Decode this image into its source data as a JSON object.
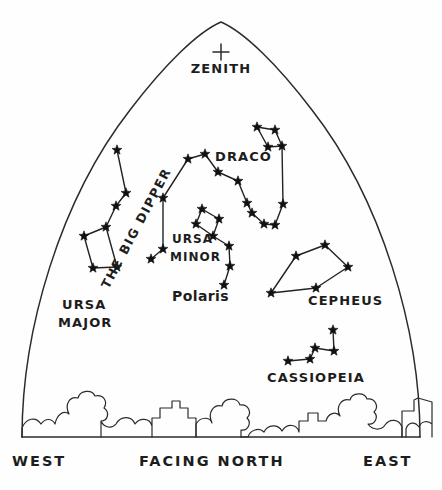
{
  "chart_data": {
    "type": "scatter",
    "view": {
      "width": 442,
      "height": 490,
      "horizon_y": 437
    },
    "zenith": {
      "label": "ZENITH",
      "marker": "plus",
      "x": 221,
      "y": 52,
      "label_x": 221,
      "label_y": 73
    },
    "constellations": [
      {
        "name": "THE BIG DIPPER",
        "label": "THE BIG DIPPER",
        "label_x": 140,
        "label_y": 230,
        "label_rotation": -62,
        "stars": [
          {
            "x": 117,
            "y": 150
          },
          {
            "x": 126,
            "y": 193
          },
          {
            "x": 116,
            "y": 206
          },
          {
            "x": 106,
            "y": 227
          },
          {
            "x": 84,
            "y": 236
          },
          {
            "x": 93,
            "y": 268
          },
          {
            "x": 117,
            "y": 267
          }
        ],
        "links": [
          [
            0,
            1
          ],
          [
            1,
            2
          ],
          [
            2,
            3
          ],
          [
            3,
            4
          ],
          [
            4,
            5
          ],
          [
            5,
            6
          ],
          [
            6,
            3
          ]
        ]
      },
      {
        "name": "URSA MAJOR",
        "label": "URSA MAJOR",
        "label_lines": [
          "URSA",
          "MAJOR"
        ],
        "label_x": 62,
        "label_y": 309,
        "stars": [],
        "links": []
      },
      {
        "name": "DRACO",
        "label": "DRACO",
        "label_x": 215,
        "label_y": 161,
        "stars": [
          {
            "x": 163,
            "y": 249
          },
          {
            "x": 151,
            "y": 259
          },
          {
            "x": 163,
            "y": 198
          },
          {
            "x": 188,
            "y": 159
          },
          {
            "x": 205,
            "y": 154
          },
          {
            "x": 218,
            "y": 172
          },
          {
            "x": 238,
            "y": 181
          },
          {
            "x": 247,
            "y": 203
          },
          {
            "x": 252,
            "y": 213
          },
          {
            "x": 264,
            "y": 224
          },
          {
            "x": 275,
            "y": 225
          },
          {
            "x": 283,
            "y": 204
          },
          {
            "x": 282,
            "y": 146
          },
          {
            "x": 257,
            "y": 127
          },
          {
            "x": 275,
            "y": 130
          },
          {
            "x": 268,
            "y": 147
          }
        ],
        "links": [
          [
            1,
            0
          ],
          [
            0,
            2
          ],
          [
            2,
            3
          ],
          [
            3,
            4
          ],
          [
            4,
            5
          ],
          [
            5,
            6
          ],
          [
            6,
            7
          ],
          [
            7,
            8
          ],
          [
            8,
            9
          ],
          [
            9,
            10
          ],
          [
            10,
            11
          ],
          [
            11,
            12
          ],
          [
            12,
            15
          ],
          [
            15,
            13
          ],
          [
            13,
            14
          ],
          [
            14,
            12
          ]
        ]
      },
      {
        "name": "URSA MINOR",
        "label": "URSA MINOR",
        "label_lines": [
          "URSA",
          "MINOR"
        ],
        "label_x": 172,
        "label_y": 243,
        "stars": [
          {
            "x": 202,
            "y": 209
          },
          {
            "x": 219,
            "y": 219
          },
          {
            "x": 196,
            "y": 224
          },
          {
            "x": 213,
            "y": 236
          },
          {
            "x": 229,
            "y": 246
          },
          {
            "x": 230,
            "y": 266
          },
          {
            "x": 224,
            "y": 285
          }
        ],
        "links": [
          [
            0,
            1
          ],
          [
            1,
            3
          ],
          [
            3,
            2
          ],
          [
            2,
            0
          ],
          [
            3,
            4
          ],
          [
            4,
            5
          ],
          [
            5,
            6
          ]
        ]
      },
      {
        "name": "Polaris",
        "label": "Polaris",
        "label_x": 200,
        "label_y": 301,
        "star": {
          "x": 224,
          "y": 285
        },
        "stars": [],
        "links": []
      },
      {
        "name": "CEPHEUS",
        "label": "CEPHEUS",
        "label_x": 308,
        "label_y": 305,
        "stars": [
          {
            "x": 325,
            "y": 245
          },
          {
            "x": 296,
            "y": 256
          },
          {
            "x": 271,
            "y": 293
          },
          {
            "x": 316,
            "y": 288
          },
          {
            "x": 348,
            "y": 267
          }
        ],
        "links": [
          [
            0,
            1
          ],
          [
            1,
            2
          ],
          [
            2,
            3
          ],
          [
            3,
            4
          ],
          [
            4,
            0
          ]
        ]
      },
      {
        "name": "CASSIOPEIA",
        "label": "CASSIOPEIA",
        "label_x": 270,
        "label_y": 382,
        "stars": [
          {
            "x": 288,
            "y": 361
          },
          {
            "x": 310,
            "y": 359
          },
          {
            "x": 315,
            "y": 348
          },
          {
            "x": 334,
            "y": 351
          },
          {
            "x": 333,
            "y": 330
          }
        ],
        "links": [
          [
            0,
            1
          ],
          [
            1,
            2
          ],
          [
            2,
            3
          ],
          [
            3,
            4
          ]
        ]
      }
    ]
  },
  "horizon": {
    "west_label": "WEST",
    "center_label": "FACING NORTH",
    "east_label": "EAST",
    "west_label_x": 12,
    "east_label_x": 363,
    "center_label_x": 139,
    "label_y": 466
  },
  "colors": {
    "ink": "#2b2b2b",
    "star": "#111111",
    "background": "#ffffff",
    "label": "#1d1d1d"
  }
}
